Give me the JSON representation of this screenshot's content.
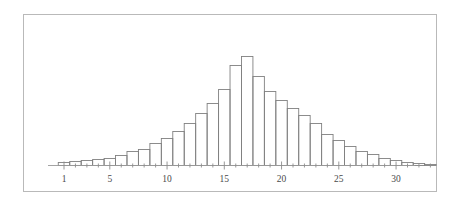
{
  "figure": {
    "frame_border_color": "#b9b9b9",
    "background_color": "#ffffff",
    "bar_stroke_color": "#808080",
    "axis_color": "#9a9a9a",
    "label_color": "#4a4a4a"
  },
  "chart_data": {
    "type": "bar",
    "title": "",
    "subtitle": "",
    "xlabel": "",
    "ylabel": "",
    "grid": false,
    "legend": false,
    "legend_position": "none",
    "orientation": "vertical",
    "bar_style": "outline-only",
    "xlim": [
      0,
      33.5
    ],
    "ylim": [
      0,
      115
    ],
    "xticks": [
      1,
      5,
      10,
      15,
      20,
      25,
      30
    ],
    "xtick_labels": [
      "1",
      "5",
      "10",
      "15",
      "20",
      "25",
      "30"
    ],
    "minor_xticks": [
      2,
      3,
      4,
      6,
      7,
      8,
      9,
      11,
      12,
      13,
      14,
      16,
      17,
      18,
      19,
      21,
      22,
      23,
      24,
      26,
      27,
      28,
      29,
      31,
      32,
      33
    ],
    "yticks": [],
    "ytick_labels": [],
    "categories": [
      1,
      2,
      3,
      4,
      5,
      6,
      7,
      8,
      9,
      10,
      11,
      12,
      13,
      14,
      15,
      16,
      17,
      18,
      19,
      20,
      21,
      22,
      23,
      24,
      25,
      26,
      27,
      28,
      29,
      30,
      31,
      32,
      33
    ],
    "values": [
      3,
      4,
      5,
      6,
      7,
      10,
      14,
      16,
      22,
      27,
      34,
      42,
      52,
      62,
      76,
      100,
      109,
      89,
      74,
      65,
      57,
      50,
      42,
      31,
      25,
      19,
      14,
      11,
      7,
      5,
      3,
      2,
      1
    ]
  }
}
